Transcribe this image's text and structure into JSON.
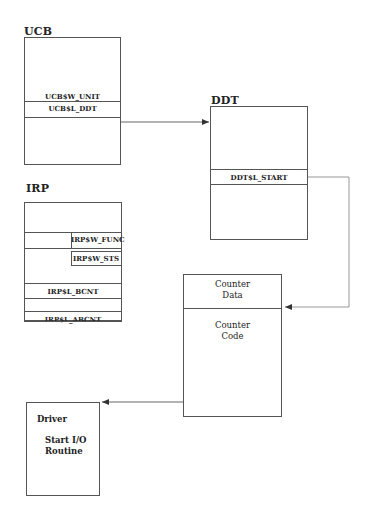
{
  "diagram": {
    "ucb": {
      "title": "UCB",
      "fields": [
        "UCB$W_UNIT",
        "UCB$L_DDT"
      ]
    },
    "ddt": {
      "title": "DDT",
      "fields": [
        "DDT$L_START"
      ]
    },
    "irp": {
      "title": "IRP",
      "fields": [
        "IRP$W_FUNC",
        "IRP$W_STS",
        "IRP$L_BCNT",
        "IRP$L_ABCNT"
      ]
    },
    "counter": {
      "data_label_line1": "Counter",
      "data_label_line2": "Data",
      "code_label_line1": "Counter",
      "code_label_line2": "Code"
    },
    "driver": {
      "title": "Driver",
      "routine_line1": "Start I/O",
      "routine_line2": "Routine"
    },
    "connections": [
      {
        "from": "UCB$L_DDT",
        "to": "DDT"
      },
      {
        "from": "DDT$L_START",
        "to": "Counter Code"
      },
      {
        "from": "Counter",
        "to": "Driver"
      }
    ],
    "colors": {
      "line": "#555555",
      "connector": "#888888",
      "text": "#222222"
    }
  }
}
